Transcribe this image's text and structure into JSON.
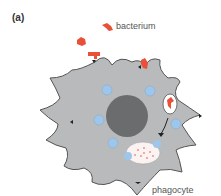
{
  "panel_label": "(a)",
  "labels": {
    "bacterium": "bacterium",
    "phagocyte": "phagocyte"
  },
  "colors": {
    "cell_fill": "#b9babc",
    "cell_stroke": "#555555",
    "nucleus": "#6b6c6e",
    "vesicle": "#9ec6ea",
    "bacterium": "#e8503a",
    "phagosome_fill": "#ffffff"
  }
}
